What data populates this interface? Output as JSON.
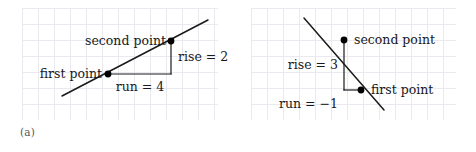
{
  "figure": {
    "background": "#ffffff",
    "grid_color": "#e9e9ef",
    "line_color": "#1a1a1a",
    "point_color": "#000000",
    "text_color": "#17191c",
    "caption_color": "#55585c"
  },
  "panels": [
    {
      "id": "a",
      "caption": "(a)",
      "grid": {
        "x": 22,
        "y": 8,
        "width": 196,
        "height": 112,
        "cell": 16
      },
      "slope_line": {
        "x1": 62,
        "y1": 96,
        "x2": 208,
        "y2": 20
      },
      "points": [
        {
          "name": "first-point",
          "label": "first point",
          "cx": 108,
          "cy": 74,
          "label_x": 102,
          "label_y": 74,
          "anchor": "right"
        },
        {
          "name": "second-point",
          "label": "second point",
          "cx": 171,
          "cy": 41,
          "label_x": 166,
          "label_y": 41,
          "anchor": "right"
        }
      ],
      "run_segment": {
        "x1": 108,
        "y1": 74,
        "x2": 171,
        "y2": 74
      },
      "rise_segment": {
        "x1": 171,
        "y1": 41,
        "x2": 171,
        "y2": 74
      },
      "run_label": {
        "text": "run = 4",
        "x": 140,
        "y": 87,
        "anchor": "center"
      },
      "rise_label": {
        "text": "rise = 2",
        "x": 178,
        "y": 57,
        "anchor": "left"
      }
    },
    {
      "id": "b",
      "caption": "(b)",
      "grid": {
        "x": 13,
        "y": 8,
        "width": 205,
        "height": 112,
        "cell": 16
      },
      "slope_line": {
        "x1": 66,
        "y1": 18,
        "x2": 146,
        "y2": 110
      },
      "points": [
        {
          "name": "second-point",
          "label": "second point",
          "cx": 106,
          "cy": 40,
          "label_x": 116,
          "label_y": 40,
          "anchor": "left"
        },
        {
          "name": "first-point",
          "label": "first point",
          "cx": 123,
          "cy": 90,
          "label_x": 133,
          "label_y": 90,
          "anchor": "left"
        }
      ],
      "run_segment": {
        "x1": 106,
        "y1": 90,
        "x2": 123,
        "y2": 90
      },
      "rise_segment": {
        "x1": 106,
        "y1": 40,
        "x2": 106,
        "y2": 90
      },
      "run_label": {
        "text": "run = −1",
        "x": 100,
        "y": 104,
        "anchor": "right"
      },
      "rise_label": {
        "text": "rise = 3",
        "x": 100,
        "y": 65,
        "anchor": "right"
      }
    }
  ]
}
